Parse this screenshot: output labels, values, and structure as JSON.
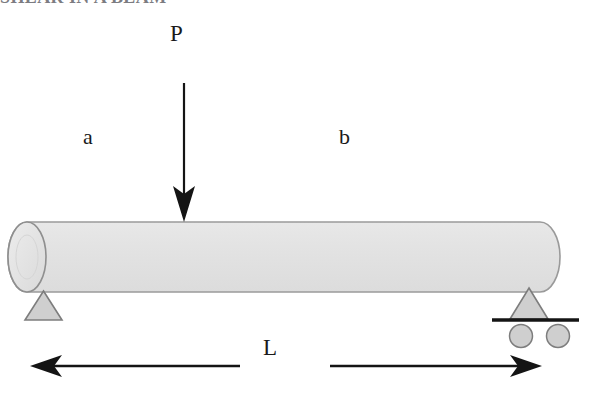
{
  "heading": {
    "text": "SHEAR IN A BEAM",
    "note": "cropped-top-partial-line"
  },
  "diagram": {
    "load_label": "P",
    "segment_left_label": "a",
    "segment_right_label": "b",
    "span_label": "L",
    "colors": {
      "beam_fill": "#e2e2e2",
      "beam_stroke": "#9a9a9a",
      "support_fill": "#cfcfcf",
      "support_stroke": "#808080",
      "line": "#141414",
      "text": "#1a1a1a",
      "background": "#ffffff"
    }
  },
  "elements": {
    "beam": "cylindrical-beam",
    "load_arrow": "downward-point-load-arrow",
    "pin_support": "pin-support-triangle",
    "roller_support": "roller-support-triangle-with-wheels",
    "dimension_line": "span-dimension-double-arrow"
  }
}
